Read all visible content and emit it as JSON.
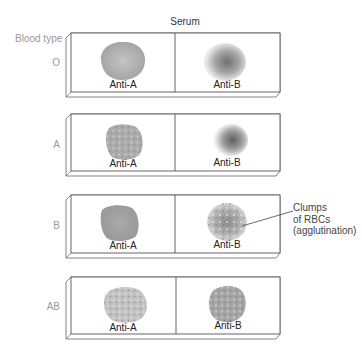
{
  "header": {
    "serum_label": "Serum",
    "blood_type_label": "Blood type"
  },
  "colors": {
    "outline": "#555555",
    "row_label": "#9a9a9a",
    "blob_fill": "#a8a8a8",
    "blob_dark": "#7a7a7a"
  },
  "rows": [
    {
      "blood_type": "O",
      "cells": [
        {
          "serum": "Anti-A",
          "result": "no agglutination"
        },
        {
          "serum": "Anti-B",
          "result": "no agglutination"
        }
      ]
    },
    {
      "blood_type": "A",
      "cells": [
        {
          "serum": "Anti-A",
          "result": "agglutination"
        },
        {
          "serum": "Anti-B",
          "result": "no agglutination"
        }
      ]
    },
    {
      "blood_type": "B",
      "cells": [
        {
          "serum": "Anti-A",
          "result": "no agglutination"
        },
        {
          "serum": "Anti-B",
          "result": "agglutination"
        }
      ]
    },
    {
      "blood_type": "AB",
      "cells": [
        {
          "serum": "Anti-A",
          "result": "agglutination"
        },
        {
          "serum": "Anti-B",
          "result": "agglutination"
        }
      ]
    }
  ],
  "callout": {
    "line1": "Clumps",
    "line2": "of RBCs",
    "line3": "(agglutination)"
  }
}
